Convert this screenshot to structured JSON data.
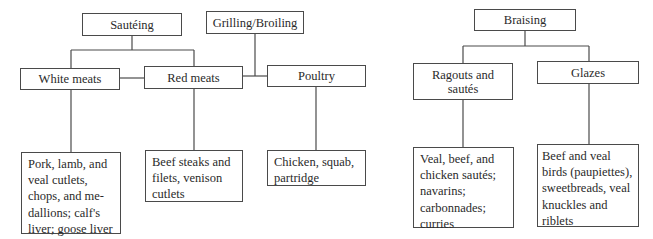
{
  "left_group": {
    "methods": {
      "sauteing": "Sautéing",
      "grilling": "Grilling/Broiling"
    },
    "categories": {
      "white_meats": "White meats",
      "red_meats": "Red meats",
      "poultry": "Poultry"
    },
    "examples": {
      "white_meats": "Pork, lamb, and\nveal cutlets,\nchops, and me-\ndallions; calf's\nliver; goose liver",
      "red_meats": "Beef steaks and\nfilets, venison\ncutlets",
      "poultry": "Chicken, squab,\npartridge"
    }
  },
  "right_group": {
    "methods": {
      "braising": "Braising"
    },
    "categories": {
      "ragouts": "Ragouts and\nsautés",
      "glazes": "Glazes"
    },
    "examples": {
      "ragouts": "Veal, beef, and\nchicken sautés;\nnavarins;\ncarbonnades;\ncurries",
      "glazes": "Beef and veal\nbirds (paupiettes),\nsweetbreads, veal\nknuckles and\nriblets"
    }
  }
}
